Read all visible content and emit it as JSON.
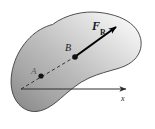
{
  "figure": {
    "kind": "statics-free-body-diagram",
    "background_color": "#ffffff",
    "body": {
      "name": "rigid-body-blob",
      "outline_color": "#3d3d3d",
      "fill_light": "#f2f2f2",
      "fill_mid": "#c8c8c8",
      "fill_dark": "#8f8f8f"
    },
    "labels": {
      "force_symbol": "F",
      "force_subscript": "R",
      "point_b": "B",
      "point_a": "A",
      "axis_x": "x"
    },
    "vector": {
      "name": "resultant-force",
      "from": "B",
      "color": "#000000",
      "start": [
        76,
        56
      ],
      "end": [
        118,
        26
      ]
    },
    "points": [
      {
        "name": "point-a-dot",
        "label": "A",
        "cx": 41,
        "cy": 76,
        "r": 2.6
      },
      {
        "name": "point-b-dot",
        "label": "B",
        "cx": 75,
        "cy": 57,
        "r": 2.8
      }
    ],
    "line_of_action": {
      "name": "dashed-line-of-action",
      "style": "dashed",
      "color": "#2e2e2e",
      "start": [
        21,
        89
      ],
      "end": [
        78,
        55
      ]
    },
    "axis": {
      "name": "x-axis",
      "color": "#2e2e2e",
      "start": [
        21,
        89
      ],
      "end": [
        128,
        89
      ],
      "arrow": true
    }
  }
}
